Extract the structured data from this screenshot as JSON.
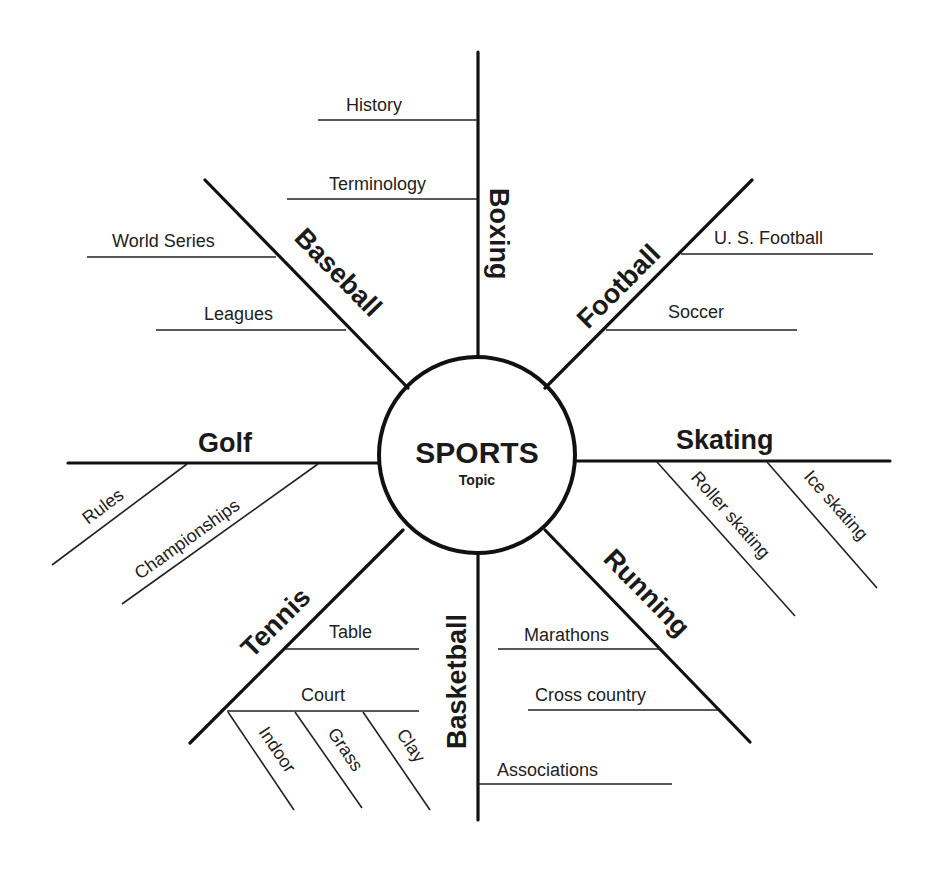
{
  "center": {
    "title": "SPORTS",
    "subtitle": "Topic"
  },
  "spokes": {
    "boxing": {
      "label": "Boxing",
      "details": [
        "History",
        "Terminology"
      ]
    },
    "football": {
      "label": "Football",
      "details": [
        "U. S. Football",
        "Soccer"
      ]
    },
    "baseball": {
      "label": "Baseball",
      "details": [
        "World Series",
        "Leagues"
      ]
    },
    "golf": {
      "label": "Golf",
      "details": [
        "Rules",
        "Championships"
      ]
    },
    "skating": {
      "label": "Skating",
      "details": [
        "Roller skating",
        "Ice skating"
      ]
    },
    "tennis": {
      "label": "Tennis",
      "details": [
        "Table",
        "Court"
      ],
      "court_types": [
        "Indoor",
        "Grass",
        "Clay"
      ]
    },
    "basketball": {
      "label": "Basketball",
      "details": [
        "Associations"
      ]
    },
    "running": {
      "label": "Running",
      "details": [
        "Marathons",
        "Cross country"
      ]
    }
  },
  "colors": {
    "line": "#111111",
    "text": "#1a1a1a",
    "background": "#ffffff"
  }
}
